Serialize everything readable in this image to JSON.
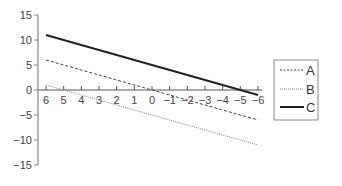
{
  "chart_data": {
    "type": "line",
    "title": "",
    "xlabel": "",
    "ylabel": "",
    "x": [
      6,
      5,
      4,
      3,
      2,
      1,
      0,
      -1,
      -2,
      -3,
      -4,
      -5,
      -6
    ],
    "x_tick_labels": [
      "6",
      "5",
      "4",
      "3",
      "2",
      "1",
      "0",
      "−1",
      "−2",
      "−3",
      "−4",
      "−5",
      "−6"
    ],
    "y_tick_labels": [
      "15",
      "10",
      "5",
      "0",
      "−5",
      "−10",
      "−15"
    ],
    "y_ticks": [
      15,
      10,
      5,
      0,
      -5,
      -10,
      -15
    ],
    "xlim": [
      6,
      -6
    ],
    "ylim": [
      -15,
      15
    ],
    "grid": false,
    "legend_position": "right",
    "series": [
      {
        "name": "A",
        "style": "dashed",
        "color": "#444444",
        "values": [
          6,
          5,
          4,
          3,
          2,
          1,
          0,
          -1,
          -2,
          -3,
          -4,
          -5,
          -6
        ]
      },
      {
        "name": "B",
        "style": "dotted",
        "color": "#888888",
        "values": [
          1,
          0,
          -1,
          -2,
          -3,
          -4,
          -5,
          -6,
          -7,
          -8,
          -9,
          -10,
          -11
        ]
      },
      {
        "name": "C",
        "style": "solid",
        "color": "#222222",
        "values": [
          11,
          10,
          9,
          8,
          7,
          6,
          5,
          4,
          3,
          2,
          1,
          0,
          -1
        ]
      }
    ]
  },
  "legend": {
    "items": [
      {
        "label": "A"
      },
      {
        "label": "B"
      },
      {
        "label": "C"
      }
    ]
  }
}
